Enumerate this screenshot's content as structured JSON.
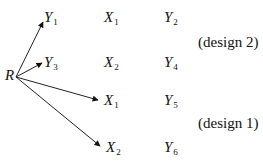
{
  "diagram": {
    "origin": {
      "label": "R"
    },
    "arrows": [
      {
        "from": "R",
        "to": "Y1"
      },
      {
        "from": "R",
        "to": "Y3"
      },
      {
        "from": "R",
        "to": "X1"
      },
      {
        "from": "R",
        "to": "X2"
      }
    ],
    "nodes": {
      "y1": {
        "base": "Y",
        "sub": "1"
      },
      "y3": {
        "base": "Y",
        "sub": "3"
      },
      "x1_col2": {
        "base": "X",
        "sub": "1"
      },
      "x2_col2": {
        "base": "X",
        "sub": "2"
      },
      "x1_arrow": {
        "base": "X",
        "sub": "1"
      },
      "x2_arrow": {
        "base": "X",
        "sub": "2"
      },
      "y2": {
        "base": "Y",
        "sub": "2"
      },
      "y4": {
        "base": "Y",
        "sub": "4"
      },
      "y5": {
        "base": "Y",
        "sub": "5"
      },
      "y6": {
        "base": "Y",
        "sub": "6"
      }
    },
    "groups": {
      "design2": "(design 2)",
      "design1": "(design 1)"
    }
  }
}
